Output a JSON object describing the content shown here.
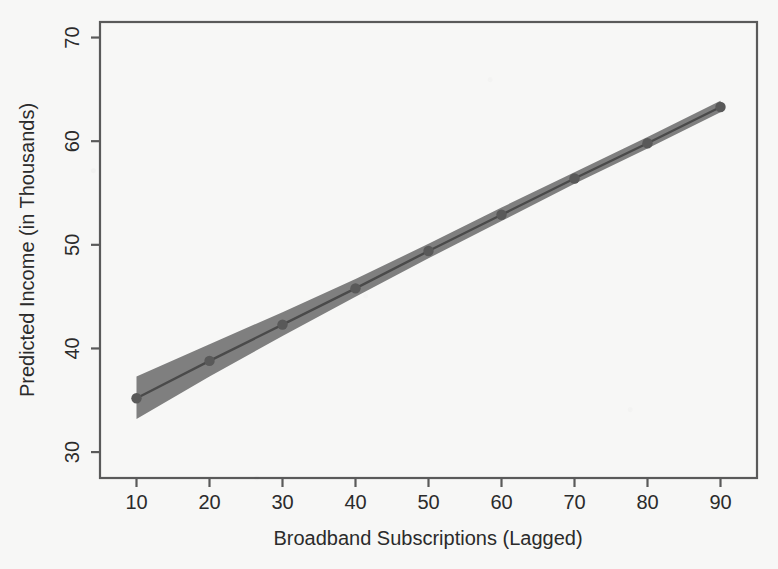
{
  "chart_data": {
    "type": "line",
    "title": "",
    "subtitle": "",
    "xlabel": "Broadband Subscriptions (Lagged)",
    "ylabel": "Predicted Income (in Thousands)",
    "xlim": [
      5,
      95
    ],
    "ylim": [
      27.5,
      71.5
    ],
    "xticks": [
      10,
      20,
      30,
      40,
      50,
      60,
      70,
      80,
      90
    ],
    "xtick_labels": [
      "10",
      "20",
      "30",
      "40",
      "50",
      "60",
      "70",
      "80",
      "90"
    ],
    "yticks": [
      30,
      40,
      50,
      60,
      70
    ],
    "ytick_labels": [
      "30",
      "40",
      "50",
      "60",
      "70"
    ],
    "grid": false,
    "legend": "none",
    "x": [
      10,
      20,
      30,
      40,
      50,
      60,
      70,
      80,
      90
    ],
    "series": [
      {
        "name": "Predicted Income",
        "values": [
          35.2,
          38.8,
          42.3,
          45.8,
          49.4,
          52.9,
          56.4,
          59.8,
          63.3
        ],
        "marker": "circle",
        "color": "#4a4a4a"
      }
    ],
    "confidence_band": {
      "name": "95% Confidence Interval",
      "lower": [
        33.2,
        37.3,
        41.2,
        45.0,
        48.7,
        52.3,
        55.9,
        59.3,
        62.8
      ],
      "upper": [
        37.3,
        40.4,
        43.5,
        46.7,
        50.1,
        53.6,
        57.0,
        60.4,
        63.9
      ],
      "color": "#7f7f7f",
      "opacity": 1.0
    },
    "annotations": []
  },
  "style": {
    "background_color": "#f7f7f6",
    "frame_color": "#5a5a5a",
    "line_color": "#4a4a4a",
    "band_color": "#7f7f7f",
    "marker_color": "#595959",
    "text_color": "#2b2b2b"
  },
  "axes": {
    "y_axis_name": "y-axis",
    "x_axis_name": "x-axis"
  }
}
